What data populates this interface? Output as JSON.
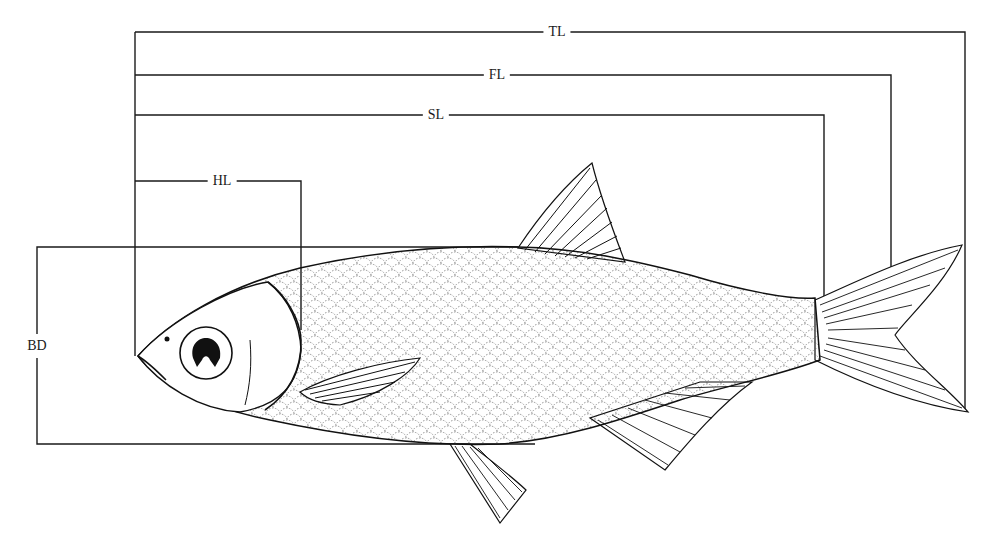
{
  "diagram": {
    "measurements": [
      {
        "key": "TL",
        "label": "TL",
        "name": "total length"
      },
      {
        "key": "FL",
        "label": "FL",
        "name": "fork length"
      },
      {
        "key": "SL",
        "label": "SL",
        "name": "standard length"
      },
      {
        "key": "HL",
        "label": "HL",
        "name": "head length"
      },
      {
        "key": "BD",
        "label": "BD",
        "name": "body depth"
      }
    ],
    "labels": {
      "tl": "TL",
      "fl": "FL",
      "sl": "SL",
      "hl": "HL",
      "bd": "BD"
    },
    "colors": {
      "line": "#1a1a1a",
      "background": "#ffffff"
    }
  }
}
